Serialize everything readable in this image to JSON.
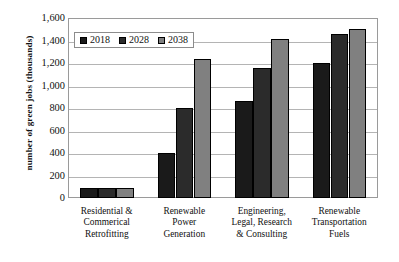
{
  "chart_data": {
    "type": "bar",
    "title": "",
    "xlabel": "",
    "ylabel": "number of green jobs (thousands)",
    "ylim": [
      0,
      1600
    ],
    "ytick_step": 200,
    "grid": true,
    "legend_position": "top-left inside plot",
    "categories": [
      "Residential & Commerical Retrofitting",
      "Renewable Power Generation",
      "Engineering, Legal, Research & Consulting",
      "Renewable Transportation Fuels"
    ],
    "category_lines": [
      [
        "Residential &",
        "Commerical",
        "Retrofitting"
      ],
      [
        "Renewable",
        "Power",
        "Generation"
      ],
      [
        "Engineering,",
        "Legal, Research",
        "& Consulting"
      ],
      [
        "Renewable",
        "Transportation",
        "Fuels"
      ]
    ],
    "ytick_labels": [
      "1,600",
      "1,400",
      "1,200",
      "1,000",
      "800",
      "600",
      "400",
      "200",
      "0"
    ],
    "ytick_values": [
      1600,
      1400,
      1200,
      1000,
      800,
      600,
      400,
      200,
      0
    ],
    "series": [
      {
        "name": "2018",
        "color": "#1a1a1a",
        "values": [
          88,
          400,
          860,
          1200
        ]
      },
      {
        "name": "2028",
        "color": "#2b2b2b",
        "values": [
          88,
          800,
          1160,
          1460
        ]
      },
      {
        "name": "2038",
        "color": "#808080",
        "values": [
          90,
          1240,
          1410,
          1500
        ]
      }
    ]
  },
  "legend": {
    "entries": [
      {
        "label": "2018",
        "color": "#1a1a1a"
      },
      {
        "label": "2028",
        "color": "#2b2b2b"
      },
      {
        "label": "2038",
        "color": "#808080"
      }
    ]
  }
}
